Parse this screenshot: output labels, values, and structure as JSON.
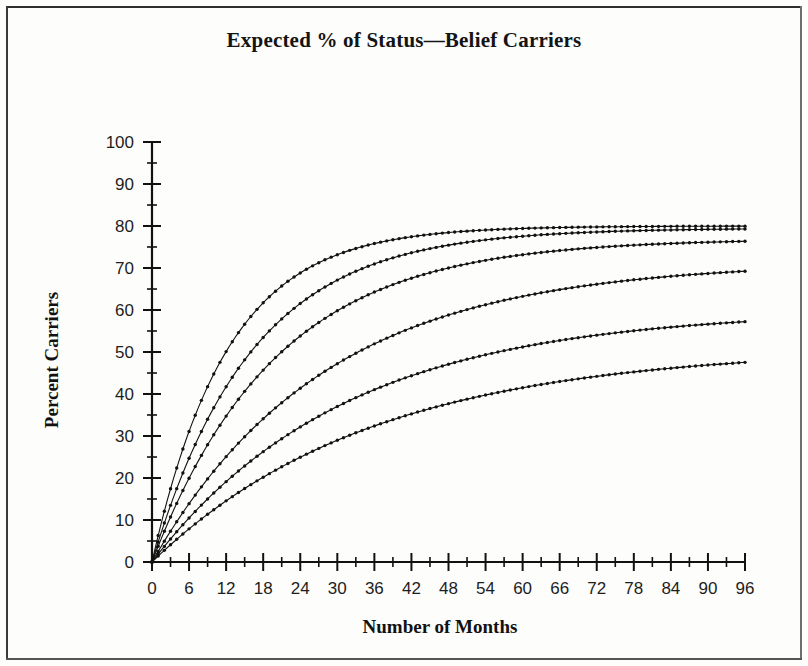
{
  "chart_data": {
    "type": "line",
    "title": "Expected % of Status—Belief Carriers",
    "xlabel": "Number of Months",
    "ylabel": "Percent Carriers",
    "xlim": [
      0,
      96
    ],
    "ylim": [
      0,
      100
    ],
    "x_major_ticks": [
      0,
      6,
      12,
      18,
      24,
      30,
      36,
      42,
      48,
      54,
      60,
      66,
      72,
      78,
      84,
      90,
      96
    ],
    "x_minor_step": 3,
    "y_major_ticks": [
      0,
      10,
      20,
      30,
      40,
      50,
      60,
      70,
      80,
      90,
      100
    ],
    "y_minor_step": 5,
    "grid": false,
    "legend": "none",
    "marker": "dot",
    "x": [
      0,
      3,
      6,
      9,
      12,
      15,
      18,
      21,
      24,
      27,
      30,
      33,
      36,
      39,
      42,
      45,
      48,
      51,
      54,
      57,
      60,
      63,
      66,
      69,
      72,
      75,
      78,
      81,
      84,
      87,
      90,
      93,
      96
    ],
    "series": [
      {
        "name": "Curve 1",
        "plateau": 80.0,
        "rate": 0.082,
        "values": [
          0.0,
          17.5,
          31.3,
          42.0,
          50.4,
          57.0,
          62.1,
          66.1,
          69.2,
          71.7,
          73.6,
          75.1,
          76.2,
          77.1,
          77.9,
          78.4,
          78.8,
          79.1,
          79.3,
          79.5,
          79.6,
          79.7,
          79.8,
          79.8,
          79.9,
          79.9,
          79.9,
          79.9,
          80.0,
          80.0,
          80.0,
          80.0,
          80.0
        ]
      },
      {
        "name": "Curve 2",
        "plateau": 79.5,
        "rate": 0.062,
        "values": [
          0.0,
          13.5,
          24.7,
          34.1,
          41.8,
          48.2,
          53.5,
          58.0,
          61.7,
          64.8,
          67.3,
          69.5,
          71.2,
          72.7,
          74.0,
          75.0,
          75.8,
          76.5,
          77.1,
          77.6,
          78.0,
          78.3,
          78.5,
          78.8,
          78.9,
          79.1,
          79.2,
          79.3,
          79.4,
          79.4,
          79.4,
          79.5,
          79.5
        ]
      },
      {
        "name": "Curve 3",
        "plateau": 77.0,
        "rate": 0.05,
        "values": [
          0.0,
          10.7,
          19.8,
          27.7,
          34.5,
          40.4,
          45.4,
          49.8,
          53.5,
          56.8,
          59.6,
          62.0,
          64.1,
          65.9,
          67.4,
          68.8,
          69.9,
          70.9,
          71.8,
          72.5,
          73.2,
          73.7,
          74.2,
          74.6,
          75.0,
          75.3,
          75.6,
          75.8,
          76.0,
          76.2,
          76.4,
          76.5,
          76.6
        ]
      },
      {
        "name": "Curve 4",
        "plateau": 71.5,
        "rate": 0.036,
        "values": [
          0.0,
          7.3,
          13.9,
          19.8,
          25.1,
          29.9,
          34.2,
          38.1,
          41.6,
          44.7,
          47.6,
          50.1,
          52.4,
          54.4,
          56.2,
          57.9,
          59.3,
          60.6,
          61.8,
          62.8,
          63.8,
          64.6,
          65.3,
          66.0,
          66.6,
          67.1,
          67.6,
          68.0,
          68.4,
          68.7,
          69.0,
          69.3,
          69.5
        ]
      },
      {
        "name": "Curve 5",
        "plateau": 60.0,
        "rate": 0.032,
        "values": [
          0.0,
          5.5,
          10.5,
          15.0,
          19.1,
          22.9,
          26.3,
          29.4,
          32.2,
          34.8,
          37.1,
          39.2,
          41.1,
          42.8,
          44.4,
          45.8,
          47.1,
          48.2,
          49.3,
          50.2,
          51.1,
          51.8,
          52.5,
          53.2,
          53.7,
          54.2,
          54.7,
          55.1,
          55.5,
          55.8,
          56.2,
          56.4,
          56.7
        ]
      },
      {
        "name": "Curve 6",
        "plateau": 51.0,
        "rate": 0.028,
        "values": [
          0.0,
          4.1,
          7.9,
          11.4,
          14.6,
          17.6,
          20.3,
          22.8,
          25.2,
          27.3,
          29.3,
          31.1,
          32.8,
          34.3,
          35.7,
          37.0,
          38.2,
          39.3,
          40.3,
          41.2,
          42.0,
          42.8,
          43.5,
          44.2,
          44.7,
          45.3,
          45.8,
          46.2,
          46.6,
          47.0,
          47.4,
          47.7,
          48.0
        ]
      }
    ]
  },
  "figure": {
    "title": "Expected % of Status—Belief Carriers",
    "x_axis_title": "Number of Months",
    "y_axis_title": "Percent Carriers"
  }
}
